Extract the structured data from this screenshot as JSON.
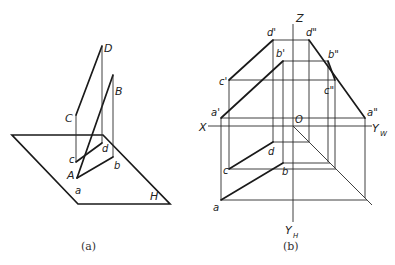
{
  "figure_a": {
    "caption": "(a)",
    "plane_label": "H",
    "points": {
      "D": "D",
      "B": "B",
      "C": "C",
      "A": "A",
      "d": "d",
      "b": "b",
      "c": "c",
      "a": "a"
    }
  },
  "figure_b": {
    "caption": "(b)",
    "axes": {
      "Z": "Z",
      "X": "X",
      "O": "O",
      "YW": "Y",
      "YW_sub": "W",
      "YH": "Y",
      "YH_sub": "H"
    },
    "points": {
      "d_prime": "d'",
      "b_prime": "b'",
      "c_prime": "c'",
      "a_prime": "a'",
      "d_dprime": "d\"",
      "b_dprime": "b\"",
      "c_dprime": "c\"",
      "a_dprime": "a\"",
      "d": "d",
      "c": "c",
      "b": "b",
      "a": "a"
    }
  }
}
